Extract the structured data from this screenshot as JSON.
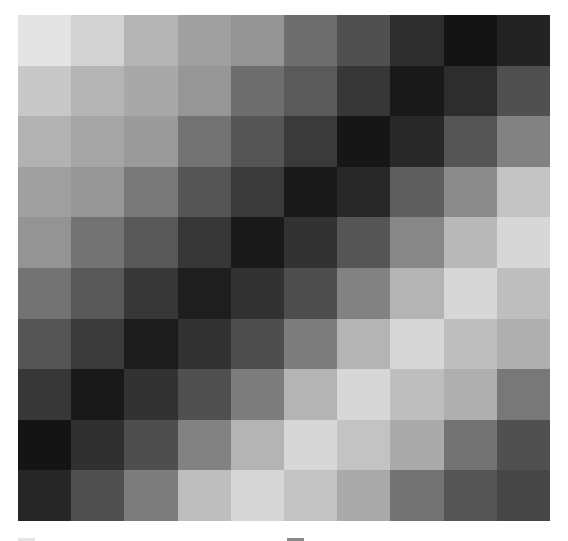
{
  "chart_data": {
    "type": "heatmap",
    "title": "",
    "xlabel": "",
    "ylabel": "",
    "colormap": "grayscale",
    "rows": 10,
    "cols": 10,
    "value_range": [
      0,
      255
    ],
    "grid": false,
    "legend": null,
    "values": [
      [
        228,
        210,
        180,
        160,
        148,
        110,
        80,
        45,
        20,
        35
      ],
      [
        200,
        180,
        168,
        150,
        110,
        90,
        55,
        25,
        45,
        80
      ],
      [
        178,
        165,
        155,
        115,
        85,
        58,
        22,
        40,
        85,
        130
      ],
      [
        160,
        150,
        120,
        85,
        58,
        25,
        40,
        95,
        140,
        195
      ],
      [
        148,
        115,
        88,
        55,
        25,
        50,
        85,
        135,
        185,
        215
      ],
      [
        115,
        88,
        55,
        30,
        50,
        78,
        130,
        180,
        215,
        190
      ],
      [
        85,
        58,
        28,
        50,
        78,
        125,
        180,
        215,
        190,
        175
      ],
      [
        55,
        25,
        50,
        80,
        125,
        180,
        215,
        190,
        175,
        120
      ],
      [
        20,
        48,
        78,
        130,
        180,
        215,
        195,
        170,
        115,
        80
      ],
      [
        38,
        80,
        125,
        190,
        215,
        195,
        170,
        115,
        85,
        70
      ]
    ]
  }
}
